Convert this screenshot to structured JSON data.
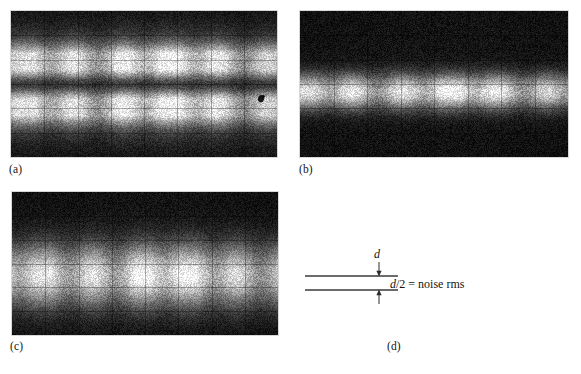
{
  "figure": {
    "background_color": "#ffffff",
    "panels": [
      {
        "id": "a",
        "caption": "(a)",
        "kind": "oscilloscope-photo",
        "description": "Noise band with dark central gap, wide vertical spread",
        "grid_divisions_x": 8,
        "grid_divisions_y": 6,
        "band_center_pct": 50,
        "band_half_width_pct": 30,
        "has_dark_center_line": true,
        "artifact_spot": {
          "x_pct": 94,
          "y_pct": 60
        }
      },
      {
        "id": "b",
        "caption": "(b)",
        "kind": "oscilloscope-photo",
        "description": "Narrow bright noise band, low amplitude",
        "grid_divisions_x": 8,
        "grid_divisions_y": 6,
        "band_center_pct": 55,
        "band_half_width_pct": 13,
        "has_dark_center_line": false,
        "artifact_spot": null
      },
      {
        "id": "c",
        "caption": "(c)",
        "kind": "oscilloscope-photo",
        "description": "Wide bright noise band, high amplitude",
        "grid_divisions_x": 8,
        "grid_divisions_y": 6,
        "band_center_pct": 58,
        "band_half_width_pct": 24,
        "has_dark_center_line": false,
        "artifact_spot": null
      }
    ]
  },
  "diagram": {
    "caption": "(d)",
    "d_label": "d",
    "equation_numerator": "d",
    "equation": "/2  =  noise rms",
    "equation_full": "d/2 = noise rms",
    "line_color": "#3a3a3a",
    "arrow_down_name": "arrow-down",
    "arrow_up_name": "arrow-up"
  },
  "colors": {
    "background": "#ffffff",
    "ink": "#141414",
    "rule": "#3a3a3a",
    "scope_dark": "#151515",
    "scope_bright": "#f2f2f2"
  }
}
